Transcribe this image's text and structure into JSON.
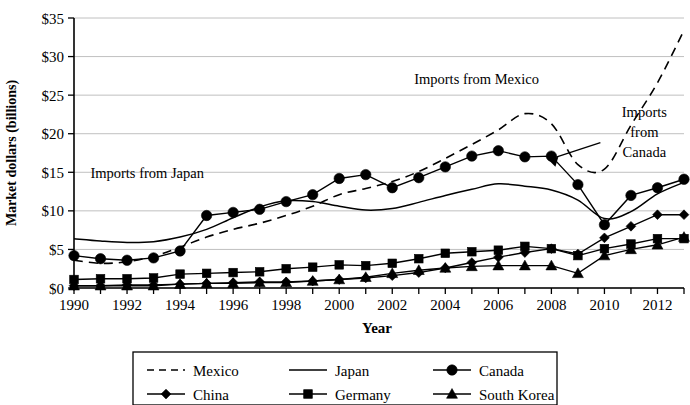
{
  "chart_data": {
    "type": "line",
    "title": "",
    "xlabel": "Year",
    "ylabel": "Market dollars (billions)",
    "xlim": [
      1990,
      2013
    ],
    "ylim": [
      0,
      35
    ],
    "grid": true,
    "legend_position": "bottom",
    "x_ticks": [
      1990,
      1992,
      1994,
      1996,
      1998,
      2000,
      2002,
      2004,
      2006,
      2008,
      2010,
      2012
    ],
    "y_ticks": [
      0,
      5,
      10,
      15,
      20,
      25,
      30,
      35
    ],
    "y_tick_labels": [
      "$0",
      "$5",
      "$10",
      "$15",
      "$20",
      "$25",
      "$30",
      "$35"
    ],
    "x": [
      1990,
      1991,
      1992,
      1993,
      1994,
      1995,
      1996,
      1997,
      1998,
      1999,
      2000,
      2001,
      2002,
      2003,
      2004,
      2005,
      2006,
      2007,
      2008,
      2009,
      2010,
      2011,
      2012,
      2013
    ],
    "series": [
      {
        "name": "Mexico",
        "style": "dashed",
        "marker": "none",
        "values": [
          3.6,
          3.2,
          3.4,
          4.1,
          5.3,
          6.6,
          7.6,
          8.4,
          9.4,
          10.6,
          12.1,
          12.9,
          13.8,
          15.1,
          16.8,
          18.6,
          20.5,
          22.6,
          21.3,
          16.0,
          15.4,
          21.1,
          26.6,
          33.4
        ]
      },
      {
        "name": "Japan",
        "style": "solid",
        "marker": "none",
        "values": [
          6.4,
          6.1,
          5.9,
          6.0,
          6.6,
          7.6,
          9.1,
          10.5,
          11.3,
          11.2,
          10.6,
          10.1,
          10.3,
          11.1,
          12.0,
          12.8,
          13.5,
          13.2,
          12.7,
          11.4,
          9.0,
          9.9,
          12.2,
          13.7
        ]
      },
      {
        "name": "Canada",
        "style": "solid",
        "marker": "circle",
        "values": [
          4.2,
          3.8,
          3.6,
          3.9,
          4.8,
          9.4,
          9.8,
          10.2,
          11.2,
          12.1,
          14.2,
          14.7,
          13.0,
          14.3,
          15.7,
          17.1,
          17.8,
          17.0,
          17.1,
          13.4,
          8.2,
          12.0,
          13.0,
          14.1
        ]
      },
      {
        "name": "China",
        "style": "solid",
        "marker": "diamond",
        "values": [
          0.3,
          0.3,
          0.4,
          0.4,
          0.5,
          0.6,
          0.7,
          0.8,
          0.8,
          0.9,
          1.1,
          1.3,
          1.6,
          2.0,
          2.6,
          3.3,
          4.0,
          4.6,
          5.1,
          4.4,
          6.5,
          8.0,
          9.5,
          9.5
        ]
      },
      {
        "name": "Germany",
        "style": "solid",
        "marker": "square",
        "values": [
          1.1,
          1.2,
          1.2,
          1.3,
          1.8,
          1.9,
          2.0,
          2.1,
          2.5,
          2.7,
          3.0,
          2.9,
          3.2,
          3.8,
          4.5,
          4.7,
          4.9,
          5.4,
          5.1,
          4.2,
          5.1,
          5.7,
          6.4,
          6.4
        ]
      },
      {
        "name": "South Korea",
        "style": "solid",
        "marker": "triangle",
        "values": [
          0.3,
          0.3,
          0.3,
          0.3,
          0.5,
          0.6,
          0.6,
          0.7,
          0.7,
          0.9,
          1.1,
          1.4,
          1.9,
          2.3,
          2.6,
          2.8,
          2.9,
          2.9,
          2.9,
          1.9,
          4.2,
          5.0,
          5.6,
          6.6
        ]
      }
    ],
    "annotations": [
      {
        "id": "imports-from-japan",
        "text": "Imports from Japan",
        "x_frac": 0.12,
        "y_value": 14.2
      },
      {
        "id": "imports-from-mexico",
        "text": "Imports from Mexico",
        "x_frac": 0.66,
        "y_value": 26.4
      },
      {
        "id": "imports-from-canada",
        "lines": [
          "Imports",
          "from",
          "Canada"
        ],
        "x_frac": 0.935,
        "y_value": 22.2
      }
    ]
  },
  "legend": {
    "entries": [
      {
        "label": "Mexico",
        "style": "dashed",
        "marker": "none"
      },
      {
        "label": "Japan",
        "style": "solid",
        "marker": "none"
      },
      {
        "label": "Canada",
        "style": "solid",
        "marker": "circle"
      },
      {
        "label": "China",
        "style": "solid",
        "marker": "diamond"
      },
      {
        "label": "Germany",
        "style": "solid",
        "marker": "square"
      },
      {
        "label": "South Korea",
        "style": "solid",
        "marker": "triangle"
      }
    ]
  },
  "colors": {
    "ink": "#000000",
    "grid": "#b9b9b9",
    "background": "#ffffff"
  }
}
